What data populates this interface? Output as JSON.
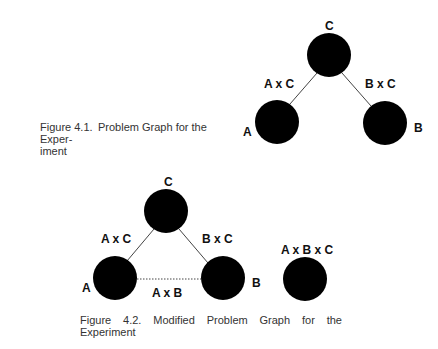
{
  "figures": [
    {
      "id": "fig-4-1",
      "caption": {
        "number": "Figure 4.1.",
        "text_line1": "Problem Graph for the Exper-",
        "text_line2": "iment"
      },
      "nodes": [
        {
          "id": "C",
          "label": "C",
          "cx": 329,
          "cy": 55
        },
        {
          "id": "A",
          "label": "A",
          "cx": 277,
          "cy": 122
        },
        {
          "id": "B",
          "label": "B",
          "cx": 385,
          "cy": 123
        }
      ],
      "edges": [
        {
          "from": "C",
          "to": "A",
          "label": "A x C",
          "style": "solid"
        },
        {
          "from": "C",
          "to": "B",
          "label": "B x C",
          "style": "solid"
        }
      ]
    },
    {
      "id": "fig-4-2",
      "caption": {
        "number": "Figure",
        "num2": "4.2.",
        "w1": "Modified",
        "w2": "Problem",
        "w3": "Graph",
        "w4": "for",
        "w5": "the",
        "text_line2": "Experiment"
      },
      "nodes": [
        {
          "id": "C",
          "label": "C",
          "cx": 166,
          "cy": 211
        },
        {
          "id": "A",
          "label": "A",
          "cx": 115,
          "cy": 278
        },
        {
          "id": "B",
          "label": "B",
          "cx": 223,
          "cy": 278
        },
        {
          "id": "ABC",
          "label": "A x B x C",
          "cx": 305,
          "cy": 278
        }
      ],
      "edges": [
        {
          "from": "C",
          "to": "A",
          "label": "A x C",
          "style": "solid"
        },
        {
          "from": "C",
          "to": "B",
          "label": "B x C",
          "style": "solid"
        },
        {
          "from": "A",
          "to": "B",
          "label": "A x B",
          "style": "dotted"
        }
      ]
    }
  ],
  "labels": {
    "f1": {
      "C": "C",
      "A": "A",
      "B": "B",
      "AC": "A x C",
      "BC": "B x C"
    },
    "f2": {
      "C": "C",
      "A": "A",
      "B": "B",
      "AC": "A x C",
      "BC": "B x C",
      "AB": "A x B",
      "ABC": "A x B x C"
    }
  },
  "colors": {
    "node": "#000000",
    "edge": "#444444",
    "text": "#111111",
    "caption": "#333333"
  }
}
